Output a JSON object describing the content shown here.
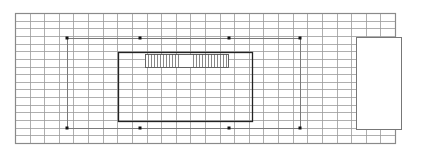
{
  "diagram": {
    "type": "floor-plan-grid",
    "grid": {
      "left": 15,
      "top": 13,
      "right": 395,
      "bottom": 143,
      "columns": 26,
      "rows": 17,
      "line_color": "#9a9a9a",
      "border_color": "#8a8a8a"
    },
    "outer_frame": {
      "left": 67,
      "top": 38,
      "right": 300,
      "bottom": 128,
      "line_color": "#7a7a7a"
    },
    "markers": [
      {
        "x": 67,
        "y": 38
      },
      {
        "x": 140,
        "y": 38
      },
      {
        "x": 229,
        "y": 38
      },
      {
        "x": 300,
        "y": 38
      },
      {
        "x": 67,
        "y": 128
      },
      {
        "x": 140,
        "y": 128
      },
      {
        "x": 229,
        "y": 128
      },
      {
        "x": 300,
        "y": 128
      }
    ],
    "inner_rect": {
      "left": 118,
      "top": 52,
      "right": 252,
      "bottom": 121,
      "line_color": "#222222"
    },
    "hatched_strip": {
      "left": 145,
      "top": 54,
      "right": 228,
      "bottom": 67,
      "gap_start": 178,
      "gap_end": 192,
      "hatch_spacing": 3,
      "line_color": "#555555"
    },
    "white_block": {
      "left": 356,
      "top": 37,
      "right": 401,
      "bottom": 129,
      "line_color": "#777777"
    },
    "colors": {
      "background": "#ffffff",
      "marker": "#111111"
    }
  }
}
